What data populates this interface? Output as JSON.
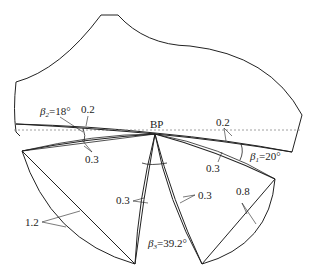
{
  "diagram": {
    "center_label": "BP",
    "annotations": {
      "beta2": {
        "symbol": "β",
        "sub": "2",
        "value": "=18°"
      },
      "beta1": {
        "symbol": "β",
        "sub": "1",
        "value": "=20°"
      },
      "beta3": {
        "symbol": "β",
        "sub": "3",
        "value": "=39.2°"
      },
      "top_left_thickness": "0.2",
      "left_thickness": "0.3",
      "top_right_thickness": "0.2",
      "right_thickness": "0.3",
      "center_left_thickness": "0.3",
      "center_right_thickness": "0.3",
      "left_blade_thickness": "1.2",
      "right_blade_thickness": "0.8"
    },
    "colors": {
      "line": "#222222",
      "dashed": "#888888",
      "background": "#ffffff"
    }
  }
}
